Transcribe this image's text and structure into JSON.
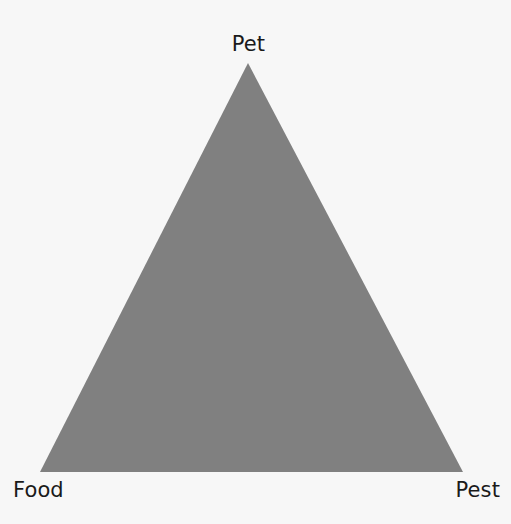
{
  "figure": {
    "background_color": "#f7f7f7",
    "text_color": "#1a1a1a"
  },
  "chart_data": {
    "type": "diagram",
    "shape": "triangle",
    "title": "",
    "subtitle": "",
    "xlabel": "",
    "ylabel": "",
    "grid": false,
    "legend": "none",
    "fill_color": "#808080",
    "background_color": "#f7f7f7",
    "canvas": {
      "width": 511,
      "height": 524
    },
    "vertices": [
      {
        "name": "apex",
        "label": "Pet",
        "x": 248,
        "y": 63
      },
      {
        "name": "bottom-left",
        "label": "Food",
        "x": 40,
        "y": 472
      },
      {
        "name": "bottom-right",
        "label": "Pest",
        "x": 463,
        "y": 472
      }
    ],
    "categories": [
      "Pet",
      "Food",
      "Pest"
    ],
    "values": [
      1,
      1,
      1
    ],
    "annotations": []
  },
  "labels": {
    "apex": "Pet",
    "bottom_left": "Food",
    "bottom_right": "Pest"
  }
}
